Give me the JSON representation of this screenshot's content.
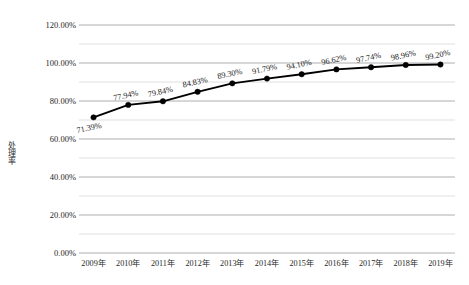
{
  "chart_data": {
    "type": "line",
    "title": "",
    "xlabel": "",
    "ylabel": "处理率",
    "categories": [
      "2009年",
      "2010年",
      "2011年",
      "2012年",
      "2013年",
      "2014年",
      "2015年",
      "2016年",
      "2017年",
      "2018年",
      "2019年"
    ],
    "values": [
      71.39,
      77.94,
      79.84,
      84.83,
      89.3,
      91.79,
      94.1,
      96.62,
      97.74,
      98.96,
      99.2
    ],
    "point_labels": [
      "71.39%",
      "77.94%",
      "79.84%",
      "84.83%",
      "89.30%",
      "91.79%",
      "94.10%",
      "96.62%",
      "97.74%",
      "98.96%",
      "99.20%"
    ],
    "ylim": [
      0,
      120
    ],
    "ytick_values": [
      0,
      20,
      40,
      60,
      80,
      100,
      120
    ],
    "ytick_labels": [
      "0.00%",
      "20.00%",
      "40.00%",
      "60.00%",
      "80.00%",
      "100.00%",
      "120.00%"
    ],
    "minor_gridline_values": [
      10,
      30,
      50,
      70,
      90,
      110
    ],
    "grid": true,
    "legend": "none",
    "series_color": "#000000",
    "marker": "circle",
    "marker_color": "#000000",
    "gridline_color_major": "#9a9a9a",
    "gridline_color_minor": "#c9c9c9",
    "background_color": "#ffffff",
    "label_rotation_deg": -12,
    "units": "percent"
  }
}
